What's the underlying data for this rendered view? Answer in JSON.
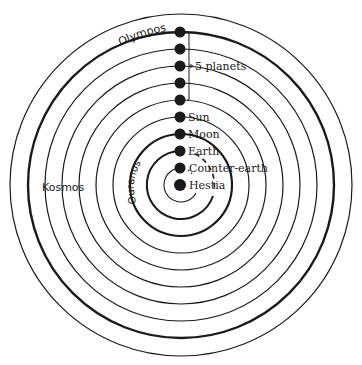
{
  "diagram": {
    "center": {
      "x": 181,
      "y": 185
    },
    "colors": {
      "ink": "#1a1a1a",
      "background": "#ffffff"
    },
    "outer_circle_radius": 171,
    "regions": {
      "olympos": "Olympos",
      "kosmos": "Kosmos",
      "ouranos": "Ouranos"
    },
    "bracket_label": "5 planets",
    "bodies": [
      {
        "name": "Olympos sphere",
        "label": "",
        "radius": 153,
        "thick": true
      },
      {
        "name": "Planet 1",
        "label": "",
        "radius": 136,
        "thick": false
      },
      {
        "name": "Planet 2",
        "label": "",
        "radius": 119,
        "thick": false
      },
      {
        "name": "Planet 3",
        "label": "",
        "radius": 102,
        "thick": false
      },
      {
        "name": "Planet 4",
        "label": "",
        "radius": 85,
        "thick": false
      },
      {
        "name": "Planet 5 / Sun orbit",
        "label": "Sun",
        "radius": 68,
        "thick": false
      },
      {
        "name": "Moon",
        "label": "Moon",
        "radius": 51,
        "thick": true
      },
      {
        "name": "Earth",
        "label": "Earth",
        "radius": 34,
        "thick": true
      },
      {
        "name": "Counter-earth",
        "label": "Counter-earth",
        "radius": 17,
        "thick": false
      },
      {
        "name": "Hestia",
        "label": "Hestia",
        "radius": 0,
        "thick": false
      }
    ],
    "labels": {
      "sun": "Sun",
      "moon": "Moon",
      "earth": "Earth",
      "counter_earth": "Counter-earth",
      "hestia": "Hestia"
    }
  }
}
